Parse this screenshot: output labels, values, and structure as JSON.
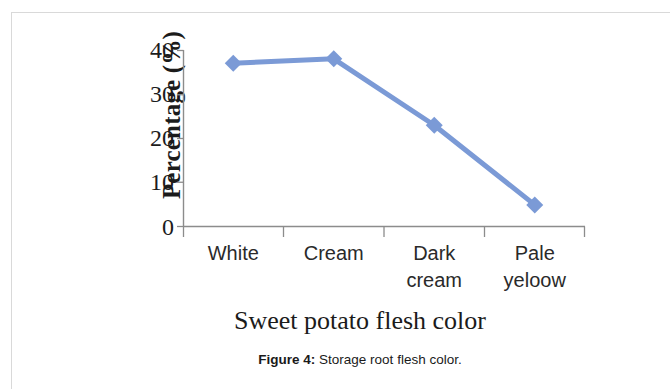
{
  "figure": {
    "caption_label": "Figure 4:",
    "caption_text": " Storage root flesh color."
  },
  "chart_data": {
    "type": "line",
    "title": "",
    "xlabel": "Sweet potato flesh color",
    "ylabel": "Percentage (%)",
    "categories": [
      "White",
      "Cream",
      "Dark cream",
      "Pale yeloow"
    ],
    "category_lines": [
      [
        "White",
        ""
      ],
      [
        "Cream",
        ""
      ],
      [
        "Dark",
        "cream"
      ],
      [
        "Pale",
        "yeloow"
      ]
    ],
    "values": [
      37,
      38,
      23,
      5
    ],
    "ylim": [
      0,
      40
    ],
    "ytick_labels": [
      "40",
      "30",
      "20",
      "10",
      "0"
    ],
    "ytick_values": [
      40,
      30,
      20,
      10,
      0
    ],
    "grid": false,
    "legend": "none",
    "series_color": "#7b9ad6",
    "axis_color": "#8c8c8c",
    "marker": "diamond"
  }
}
